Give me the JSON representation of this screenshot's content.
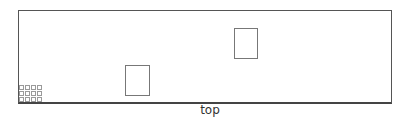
{
  "diagram": {
    "view_label": "top",
    "frame": {
      "x": 18,
      "y": 10,
      "w": 373,
      "h": 92,
      "color": "#555555"
    },
    "rects": [
      {
        "name": "rect-lower-left",
        "x": 125,
        "y": 65,
        "w": 25,
        "h": 31,
        "color": "#777777"
      },
      {
        "name": "rect-upper-right",
        "x": 234,
        "y": 28,
        "w": 24,
        "h": 31,
        "color": "#777777"
      }
    ],
    "grid": {
      "columns": 4,
      "rows": 3,
      "cell_color": "#9a9a9a"
    }
  }
}
